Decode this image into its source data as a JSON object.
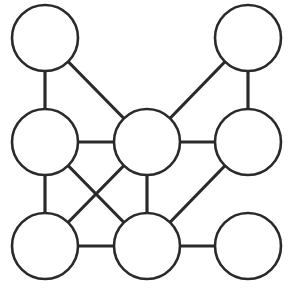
{
  "diagram": {
    "type": "undirected-graph",
    "stroke_color": "#2a2a2a",
    "fill_color": "#ffffff",
    "node_radius": 33,
    "nodes": [
      {
        "id": "A",
        "x": 45,
        "y": 38
      },
      {
        "id": "B",
        "x": 248,
        "y": 38
      },
      {
        "id": "C",
        "x": 45,
        "y": 142
      },
      {
        "id": "D",
        "x": 147,
        "y": 142
      },
      {
        "id": "E",
        "x": 248,
        "y": 142
      },
      {
        "id": "F",
        "x": 45,
        "y": 246
      },
      {
        "id": "G",
        "x": 147,
        "y": 246
      },
      {
        "id": "H",
        "x": 248,
        "y": 246
      }
    ],
    "edges": [
      [
        "A",
        "C"
      ],
      [
        "A",
        "D"
      ],
      [
        "B",
        "D"
      ],
      [
        "B",
        "E"
      ],
      [
        "C",
        "D"
      ],
      [
        "D",
        "E"
      ],
      [
        "C",
        "F"
      ],
      [
        "C",
        "G"
      ],
      [
        "D",
        "F"
      ],
      [
        "D",
        "G"
      ],
      [
        "E",
        "G"
      ],
      [
        "F",
        "G"
      ],
      [
        "G",
        "H"
      ]
    ]
  }
}
